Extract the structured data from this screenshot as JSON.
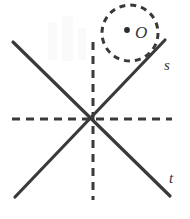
{
  "figure": {
    "background_color": "#ffffff",
    "stroke_color": "#3a3a3a",
    "label_color": "#333333",
    "width": 190,
    "height": 219,
    "labels": {
      "line_s": "s",
      "line_t": "t",
      "point_o": "O"
    },
    "geometry": {
      "intersection": {
        "x": 93,
        "y": 119
      },
      "line_s": {
        "style": "solid",
        "x1": 15,
        "y1": 197,
        "x2": 165,
        "y2": 40,
        "label_x": 164,
        "label_y": 70
      },
      "line_t": {
        "style": "solid",
        "x1": 13,
        "y1": 42,
        "x2": 170,
        "y2": 196,
        "label_x": 169,
        "label_y": 183
      },
      "horizontal_axis": {
        "style": "dashed",
        "x1": 12,
        "y1": 119,
        "x2": 172,
        "y2": 119,
        "dash": "8 6"
      },
      "vertical_axis": {
        "style": "dashed",
        "x1": 93,
        "y1": 42,
        "x2": 93,
        "y2": 200,
        "dash": "8 6"
      },
      "circle": {
        "style": "dashed",
        "cx": 130,
        "cy": 33,
        "r": 28,
        "dash": "6 5"
      },
      "point_o": {
        "cx": 127,
        "cy": 30,
        "r": 2.8,
        "label_x": 135,
        "label_y": 38
      }
    }
  }
}
